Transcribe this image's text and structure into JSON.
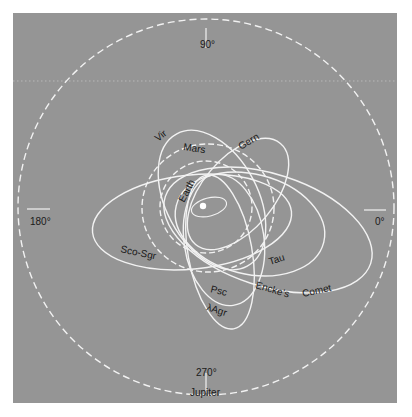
{
  "diagram": {
    "type": "meteor-stream orbit diagram (ecliptic projection)",
    "background_color": "#959595",
    "line_color": "#f2f2f2",
    "text_color": "#1a1a1a",
    "center": {
      "x": 206,
      "y": 207,
      "label": "Sun"
    },
    "angle_labels": {
      "deg0": "0°",
      "deg90": "90°",
      "deg180": "180°",
      "deg270": "270°"
    },
    "planet_orbits": {
      "jupiter": "Jupiter",
      "mars": "Mars",
      "earth": "Earth"
    },
    "streams": {
      "vir": "Vir",
      "gern": "Gern",
      "sco_sgr": "Sco-Sgr",
      "tau": "Tau",
      "encke": "Encke's Comet",
      "encke_word1": "Encke's",
      "encke_word2": "Comet",
      "psc": "Psc",
      "lambda_agr": "λAgr"
    }
  }
}
